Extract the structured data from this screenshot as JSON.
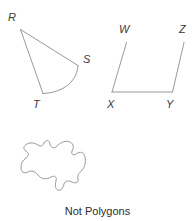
{
  "figure": {
    "caption": "Not Polygons",
    "background_color": "#ffffff",
    "stroke_color": "#8d8d8d",
    "label_color": "#3a3a3a",
    "caption_color": "#2b2b2b",
    "shapes": [
      {
        "id": "shape-rst",
        "name": "curved-three-sided-figure-RST",
        "description": "Figure with vertices R, S, T; sides R-S and R-T are straight segments while side S-T is a curved arc, so it is not a polygon.",
        "vertices": [
          {
            "label": "R",
            "x": 20,
            "y": 29,
            "label_x": 8,
            "label_y": 21
          },
          {
            "label": "S",
            "x": 78,
            "y": 65,
            "label_x": 83,
            "label_y": 63
          },
          {
            "label": "T",
            "x": 43,
            "y": 93,
            "label_x": 33,
            "label_y": 108
          }
        ],
        "sides": [
          {
            "from": "R",
            "to": "S",
            "type": "straight"
          },
          {
            "from": "S",
            "to": "T",
            "type": "curved"
          },
          {
            "from": "T",
            "to": "R",
            "type": "straight"
          }
        ]
      },
      {
        "id": "shape-wxyz",
        "name": "open-four-sided-figure-WXYZ",
        "description": "Figure with labelled points W, X, Y, Z; segments W-X, X-Y and Y-Z are drawn but the figure is open between W and Z, so it is not a polygon.",
        "vertices": [
          {
            "label": "W",
            "x": 127,
            "y": 42,
            "label_x": 119,
            "label_y": 33
          },
          {
            "label": "X",
            "x": 112,
            "y": 92,
            "label_x": 107,
            "label_y": 108
          },
          {
            "label": "Y",
            "x": 172,
            "y": 92,
            "label_x": 166,
            "label_y": 108
          },
          {
            "label": "Z",
            "x": 184,
            "y": 42,
            "label_x": 179,
            "label_y": 33
          }
        ],
        "sides": [
          {
            "from": "W",
            "to": "X",
            "type": "straight"
          },
          {
            "from": "X",
            "to": "Y",
            "type": "straight"
          },
          {
            "from": "Y",
            "to": "Z",
            "type": "straight"
          },
          {
            "from": "Z",
            "to": "W",
            "type": "open"
          }
        ]
      },
      {
        "id": "shape-blob",
        "name": "closed-curved-blob",
        "description": "Unlabelled closed figure made only of curved lines, so it is not a polygon.",
        "vertices": [],
        "sides": [
          {
            "from": "",
            "to": "",
            "type": "curved"
          }
        ]
      }
    ]
  }
}
